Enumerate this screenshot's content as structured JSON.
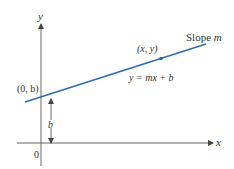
{
  "diagram": {
    "colors": {
      "line": "#2a6db5",
      "axes": "#555555",
      "text": "#333333",
      "background": "#ffffff"
    },
    "axes": {
      "x_label": "x",
      "y_label": "y",
      "origin_label": "0"
    },
    "line": {
      "label": "Slope m",
      "label_prefix": "Slope ",
      "label_var": "m",
      "equation": "y = mx + b"
    },
    "points": {
      "intercept": {
        "label": "(0, b)"
      },
      "general": {
        "label": "(x, y)"
      }
    },
    "measure": {
      "label": "b"
    }
  }
}
